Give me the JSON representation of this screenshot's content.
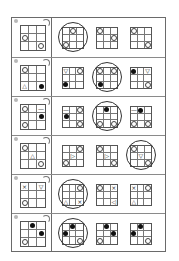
{
  "worksheet": {
    "title": "Grid rotation puzzles",
    "rows": [
      {
        "question": {
          "number_marker": "dot",
          "rotation_marker": "rotate-arrow",
          "cells": [
            "",
            "",
            "",
            "circle",
            "",
            "",
            "",
            "",
            "circle"
          ]
        },
        "options": [
          {
            "cells": [
              "",
              "circle",
              "",
              "",
              "",
              "",
              "circle",
              "",
              ""
            ],
            "selected": true
          },
          {
            "cells": [
              "circle",
              "",
              "",
              "",
              "",
              "circle",
              "",
              "",
              ""
            ],
            "selected": false
          },
          {
            "cells": [
              "circle",
              "",
              "",
              "",
              "",
              "",
              "",
              "",
              "circle"
            ],
            "selected": false
          }
        ]
      },
      {
        "question": {
          "number_marker": "dot",
          "rotation_marker": "rotate-arrow",
          "cells": [
            "circle",
            "",
            "",
            "",
            "",
            "",
            "△",
            "",
            "dot"
          ]
        },
        "options": [
          {
            "cells": [
              "▽",
              "",
              "circle",
              "",
              "",
              "",
              "dot",
              "",
              ""
            ],
            "selected": false
          },
          {
            "cells": [
              "circle",
              "",
              "circle",
              "",
              "",
              "",
              "dot",
              "",
              ""
            ],
            "selected": true
          },
          {
            "cells": [
              "dot",
              "",
              "▽",
              "",
              "",
              "",
              "",
              "",
              "circle"
            ],
            "selected": false
          }
        ]
      },
      {
        "question": {
          "number_marker": "dot",
          "rotation_marker": "rotate-arrow",
          "cells": [
            "circle",
            "",
            "—",
            "",
            "",
            "dot",
            "circle",
            "",
            ""
          ]
        },
        "options": [
          {
            "cells": [
              "—",
              "",
              "circle",
              "dot",
              "",
              "",
              "",
              "",
              "circle"
            ],
            "selected": false
          },
          {
            "cells": [
              "",
              "dot",
              "",
              "",
              "",
              "",
              "circle",
              "",
              "circle"
            ],
            "selected": true
          },
          {
            "cells": [
              "—",
              "dot",
              "",
              "",
              "",
              "",
              "circle",
              "",
              "circle"
            ],
            "selected": false
          }
        ]
      },
      {
        "question": {
          "number_marker": "dot",
          "rotation_marker": "rotate-arrow",
          "cells": [
            "circle",
            "",
            "",
            "",
            "△",
            "",
            "",
            "",
            "circle"
          ]
        },
        "options": [
          {
            "cells": [
              "",
              "",
              "circle",
              "",
              "▷",
              "",
              "circle",
              "",
              ""
            ],
            "selected": false
          },
          {
            "cells": [
              "circle",
              "",
              "",
              "",
              "▷",
              "",
              "",
              "",
              "circle"
            ],
            "selected": false
          },
          {
            "cells": [
              "circle",
              "",
              "",
              "",
              "▽",
              "",
              "",
              "",
              "circle"
            ],
            "selected": true
          }
        ]
      },
      {
        "question": {
          "number_marker": "dot",
          "rotation_marker": "rotate-arrow",
          "cells": [
            "×",
            "",
            "▽",
            "",
            "",
            "",
            "circle",
            "",
            ""
          ]
        },
        "options": [
          {
            "cells": [
              "",
              "",
              "circle",
              "",
              "",
              "",
              "△",
              "",
              "×"
            ],
            "selected": true
          },
          {
            "cells": [
              "circle",
              "",
              "×",
              "",
              "",
              "",
              "",
              "",
              "◁"
            ],
            "selected": false
          },
          {
            "cells": [
              "×",
              "",
              "circle",
              "",
              "",
              "",
              "△",
              "",
              ""
            ],
            "selected": false
          }
        ]
      },
      {
        "question": {
          "number_marker": "dot",
          "rotation_marker": "rotate-arrow",
          "cells": [
            "",
            "dot",
            "",
            "",
            "",
            "dot",
            "circle",
            "",
            ""
          ]
        },
        "options": [
          {
            "cells": [
              "",
              "dot",
              "",
              "dot",
              "",
              "",
              "",
              "",
              "circle"
            ],
            "selected": true
          },
          {
            "cells": [
              "",
              "dot",
              "",
              "",
              "",
              "dot",
              "circle",
              "",
              ""
            ],
            "selected": false
          },
          {
            "cells": [
              "",
              "dot",
              "",
              "dot",
              "",
              "",
              "",
              "",
              "circle"
            ],
            "selected": false
          }
        ]
      }
    ]
  }
}
